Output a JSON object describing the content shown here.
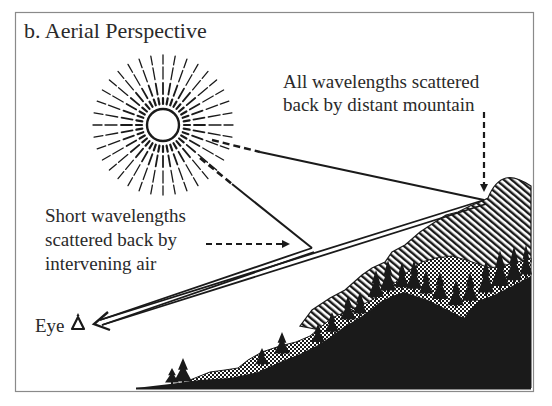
{
  "figure": {
    "title": "b. Aerial Perspective",
    "labels": {
      "mountain_lines": [
        "All wavelengths scattered",
        "back by distant mountain"
      ],
      "air_lines": [
        "Short wavelengths",
        "scattered back by",
        "intervening air"
      ],
      "eye": "Eye"
    },
    "icons": {
      "sun": "sun-icon",
      "eye": "eye-icon"
    },
    "colors": {
      "ink": "#1a1a1a",
      "background": "#ffffff",
      "frame": "#8a8a8a"
    }
  }
}
